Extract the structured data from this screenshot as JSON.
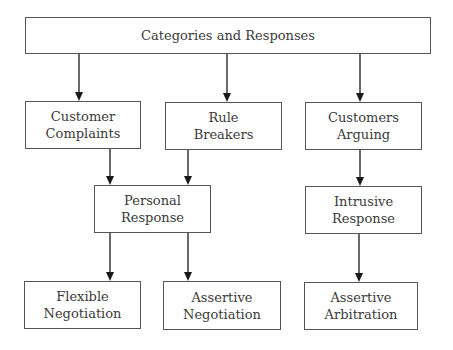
{
  "diagram": {
    "title": "Categories and Responses",
    "nodes": [
      {
        "id": "root",
        "lines": [
          "Categories and Responses"
        ],
        "x": 25,
        "y": 17,
        "w": 406,
        "h": 37
      },
      {
        "id": "customer-complaints",
        "lines": [
          "Customer",
          "Complaints"
        ],
        "x": 25,
        "y": 101,
        "w": 116,
        "h": 48
      },
      {
        "id": "rule-breakers",
        "lines": [
          "Rule",
          "Breakers"
        ],
        "x": 165,
        "y": 102,
        "w": 117,
        "h": 48
      },
      {
        "id": "customers-arguing",
        "lines": [
          "Customers",
          "Arguing"
        ],
        "x": 305,
        "y": 102,
        "w": 117,
        "h": 48
      },
      {
        "id": "personal-response",
        "lines": [
          "Personal",
          "Response"
        ],
        "x": 94,
        "y": 185,
        "w": 117,
        "h": 48
      },
      {
        "id": "intrusive-response",
        "lines": [
          "Intrusive",
          "Response"
        ],
        "x": 305,
        "y": 186,
        "w": 117,
        "h": 48
      },
      {
        "id": "flexible-negotiation",
        "lines": [
          "Flexible",
          "Negotiation"
        ],
        "x": 24,
        "y": 281,
        "w": 117,
        "h": 48
      },
      {
        "id": "assertive-negotiation",
        "lines": [
          "Assertive",
          "Negotiation"
        ],
        "x": 163,
        "y": 281,
        "w": 118,
        "h": 49
      },
      {
        "id": "assertive-arbitration",
        "lines": [
          "Assertive",
          "Arbitration"
        ],
        "x": 304,
        "y": 282,
        "w": 114,
        "h": 48
      }
    ],
    "edges": [
      {
        "from": "root",
        "to": "customer-complaints",
        "x": 79,
        "y1": 54,
        "y2": 101
      },
      {
        "from": "root",
        "to": "rule-breakers",
        "x": 227,
        "y1": 54,
        "y2": 102
      },
      {
        "from": "root",
        "to": "customers-arguing",
        "x": 360,
        "y1": 54,
        "y2": 102
      },
      {
        "from": "customer-complaints",
        "to": "personal-response",
        "x": 110,
        "y1": 149,
        "y2": 185
      },
      {
        "from": "rule-breakers",
        "to": "personal-response",
        "x": 188,
        "y1": 150,
        "y2": 185
      },
      {
        "from": "customers-arguing",
        "to": "intrusive-response",
        "x": 360,
        "y1": 150,
        "y2": 186
      },
      {
        "from": "personal-response",
        "to": "flexible-negotiation",
        "x": 110,
        "y1": 233,
        "y2": 281
      },
      {
        "from": "personal-response",
        "to": "assertive-negotiation",
        "x": 188,
        "y1": 233,
        "y2": 281
      },
      {
        "from": "intrusive-response",
        "to": "assertive-arbitration",
        "x": 359,
        "y1": 234,
        "y2": 282
      }
    ],
    "colors": {
      "stroke": "#555555",
      "text": "#3a3a3a",
      "arrow": "#1a1a1a",
      "background": "#ffffff"
    }
  }
}
